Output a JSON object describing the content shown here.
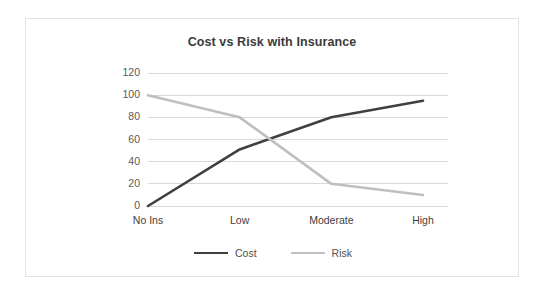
{
  "chart_data": {
    "type": "line",
    "title": "Cost vs Risk with Insurance",
    "xlabel": "",
    "ylabel": "",
    "categories": [
      "No Ins",
      "Low",
      "Moderate",
      "High"
    ],
    "series": [
      {
        "name": "Cost",
        "values": [
          0,
          51,
          80,
          95
        ],
        "color": "#404040"
      },
      {
        "name": "Risk",
        "values": [
          100,
          80,
          20,
          10
        ],
        "color": "#bfbfbf"
      }
    ],
    "ylim": [
      0,
      120
    ],
    "ytick_labels": [
      "0",
      "20",
      "40",
      "60",
      "80",
      "100",
      "120"
    ],
    "ytick_values": [
      0,
      20,
      40,
      60,
      80,
      100,
      120
    ],
    "grid": true,
    "grid_color": "#d9d9d9",
    "legend_position": "bottom",
    "background": "#ffffff",
    "border_color": "#e3e3e3"
  },
  "legend": {
    "items": [
      {
        "label": "Cost"
      },
      {
        "label": "Risk"
      }
    ]
  }
}
